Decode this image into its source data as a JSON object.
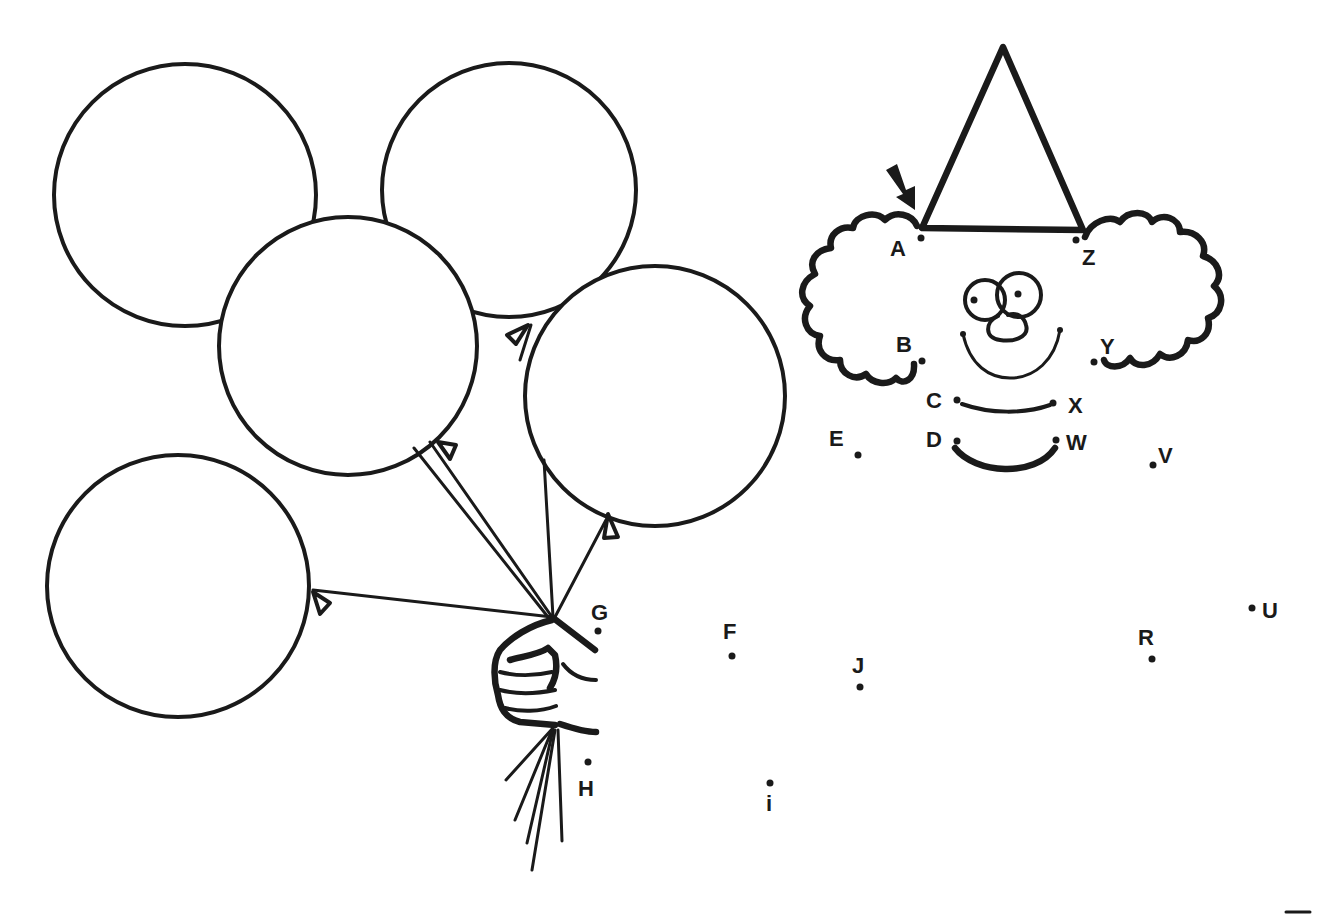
{
  "worksheet": {
    "type": "connect-the-dots",
    "ink_color": "#1a1a1a",
    "background_color": "#ffffff",
    "start_arrow": {
      "points_to": "A"
    },
    "dots": [
      {
        "label": "A",
        "x": 921,
        "y": 238,
        "lx": 890,
        "ly": 256
      },
      {
        "label": "B",
        "x": 922,
        "y": 361,
        "lx": 896,
        "ly": 352
      },
      {
        "label": "C",
        "x": 957,
        "y": 400,
        "lx": 926,
        "ly": 408
      },
      {
        "label": "D",
        "x": 957,
        "y": 441,
        "lx": 926,
        "ly": 447
      },
      {
        "label": "E",
        "x": 858,
        "y": 455,
        "lx": 829,
        "ly": 446
      },
      {
        "label": "F",
        "x": 732,
        "y": 656,
        "lx": 723,
        "ly": 639
      },
      {
        "label": "G",
        "x": 598,
        "y": 631,
        "lx": 591,
        "ly": 620
      },
      {
        "label": "H",
        "x": 588,
        "y": 762,
        "lx": 578,
        "ly": 796
      },
      {
        "label": "i",
        "x": 770,
        "y": 783,
        "lx": 766,
        "ly": 811
      },
      {
        "label": "J",
        "x": 860,
        "y": 687,
        "lx": 852,
        "ly": 673
      },
      {
        "label": "R",
        "x": 1152,
        "y": 659,
        "lx": 1138,
        "ly": 645
      },
      {
        "label": "U",
        "x": 1252,
        "y": 608,
        "lx": 1262,
        "ly": 618
      },
      {
        "label": "V",
        "x": 1153,
        "y": 465,
        "lx": 1158,
        "ly": 463
      },
      {
        "label": "W",
        "x": 1056,
        "y": 440,
        "lx": 1066,
        "ly": 450
      },
      {
        "label": "X",
        "x": 1053,
        "y": 403,
        "lx": 1068,
        "ly": 413
      },
      {
        "label": "Y",
        "x": 1094,
        "y": 362,
        "lx": 1100,
        "ly": 354
      },
      {
        "label": "Z",
        "x": 1076,
        "y": 240,
        "lx": 1082,
        "ly": 265
      }
    ],
    "balloons": [
      {
        "name": "balloon-top-left",
        "cx": 185,
        "cy": 195,
        "r": 131
      },
      {
        "name": "balloon-top-right",
        "cx": 509,
        "cy": 190,
        "r": 127
      },
      {
        "name": "balloon-middle-left",
        "cx": 348,
        "cy": 346,
        "r": 129
      },
      {
        "name": "balloon-middle-right",
        "cx": 655,
        "cy": 396,
        "r": 130
      },
      {
        "name": "balloon-bottom-left",
        "cx": 178,
        "cy": 586,
        "r": 131
      }
    ]
  }
}
